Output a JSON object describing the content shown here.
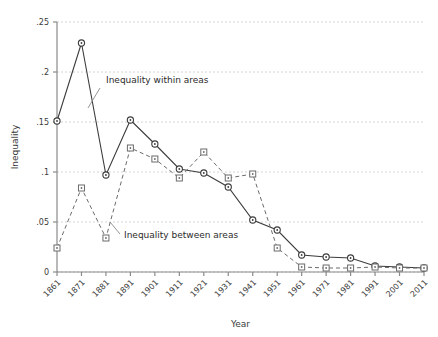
{
  "chart_data": {
    "type": "line",
    "title": "",
    "xlabel": "Year",
    "ylabel": "Inequality",
    "x": [
      1861,
      1871,
      1881,
      1891,
      1901,
      1911,
      1921,
      1931,
      1941,
      1951,
      1961,
      1971,
      1981,
      1991,
      2001,
      2011
    ],
    "categories": [
      "1861",
      "1871",
      "1881",
      "1891",
      "1901",
      "1911",
      "1921",
      "1931",
      "1941",
      "1951",
      "1961",
      "1971",
      "1981",
      "1991",
      "2001",
      "2011"
    ],
    "xlim": [
      1861,
      2011
    ],
    "ylim": [
      0,
      0.25
    ],
    "yticks": [
      0,
      0.05,
      0.1,
      0.15,
      0.2,
      0.25
    ],
    "ytick_labels": [
      "0",
      ".05",
      ".1",
      ".15",
      ".2",
      ".25"
    ],
    "grid": true,
    "legend_position": "inline-annotations",
    "series": [
      {
        "name": "Inequality within areas",
        "marker": "circle",
        "linestyle": "solid",
        "color": "#3c3c3c",
        "values": [
          0.151,
          0.229,
          0.097,
          0.152,
          0.128,
          0.103,
          0.099,
          0.085,
          0.052,
          0.042,
          0.017,
          0.015,
          0.014,
          0.006,
          0.005,
          0.004
        ]
      },
      {
        "name": "Inequality between areas",
        "marker": "square",
        "linestyle": "dashed",
        "color": "#6b6b6b",
        "values": [
          0.024,
          0.084,
          0.034,
          0.124,
          0.113,
          0.094,
          0.12,
          0.094,
          0.098,
          0.024,
          0.005,
          0.004,
          0.004,
          0.005,
          0.004,
          0.004
        ]
      }
    ],
    "annotations": [
      {
        "text": "Inequality within areas",
        "x": 1891,
        "y": 0.196
      },
      {
        "text": "Inequality between areas",
        "x": 1897,
        "y": 0.042
      }
    ]
  }
}
